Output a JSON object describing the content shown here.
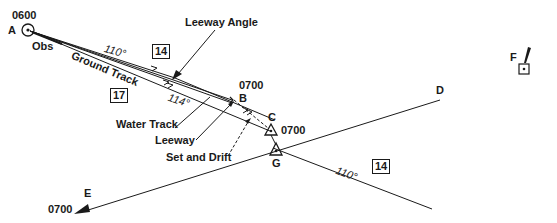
{
  "diagram": {
    "points": {
      "A": {
        "letter": "A",
        "time": "0600",
        "note": "Obs"
      },
      "B": {
        "letter": "B",
        "time": "0700"
      },
      "C": {
        "letter": "C",
        "time": "0700"
      },
      "D": {
        "letter": "D"
      },
      "E": {
        "letter": "E",
        "time": "0700"
      },
      "F": {
        "letter": "F"
      },
      "G": {
        "letter": "G"
      }
    },
    "labels": {
      "ground_track": "Ground Track",
      "heading_110_upper": "110°",
      "heading_114": "114°",
      "heading_110_lower": "110°",
      "leeway_angle": "Leeway Angle",
      "water_track": "Water Track",
      "leeway": "Leeway",
      "set_and_drift": "Set and Drift"
    },
    "boxes": {
      "speed_upper": "14",
      "speed_left": "17",
      "speed_lower": "14"
    },
    "colors": {
      "ink": "#1a1a1a",
      "background": "#ffffff"
    }
  }
}
